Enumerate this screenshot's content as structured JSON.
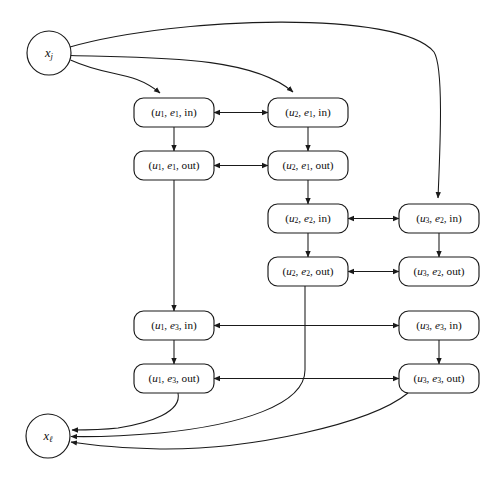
{
  "figure": {
    "type": "directed-graph-diagram",
    "canvas": {
      "width": 494,
      "height": 481
    },
    "background_color": "#ffffff",
    "stroke_color": "#1a1a1a",
    "text_color": "#0d0d0d"
  },
  "terminals": {
    "source": {
      "id": "x_j",
      "label_base": "x",
      "label_sub": "j",
      "shape": "circle",
      "cx": 49,
      "cy": 53,
      "r": 22
    },
    "sink": {
      "id": "x_l",
      "label_base": "x",
      "label_sub": "ℓ",
      "shape": "circle",
      "cx": 48,
      "cy": 436,
      "r": 22
    }
  },
  "nodes": [
    {
      "id": "u1e1in",
      "u": "u",
      "u_sub": "1",
      "e": "e",
      "e_sub": "1",
      "dir": "in",
      "text": "(u1, e1, in)",
      "x": 134,
      "y": 98,
      "w": 80,
      "h": 29
    },
    {
      "id": "u2e1in",
      "u": "u",
      "u_sub": "2",
      "e": "e",
      "e_sub": "1",
      "dir": "in",
      "text": "(u2, e1, in)",
      "x": 268,
      "y": 98,
      "w": 80,
      "h": 29
    },
    {
      "id": "u1e1out",
      "u": "u",
      "u_sub": "1",
      "e": "e",
      "e_sub": "1",
      "dir": "out",
      "text": "(u1, e1, out)",
      "x": 134,
      "y": 151,
      "w": 80,
      "h": 29
    },
    {
      "id": "u2e1out",
      "u": "u",
      "u_sub": "2",
      "e": "e",
      "e_sub": "1",
      "dir": "out",
      "text": "(u2, e1, out)",
      "x": 268,
      "y": 151,
      "w": 80,
      "h": 29
    },
    {
      "id": "u2e2in",
      "u": "u",
      "u_sub": "2",
      "e": "e",
      "e_sub": "2",
      "dir": "in",
      "text": "(u2, e2, in)",
      "x": 268,
      "y": 204,
      "w": 80,
      "h": 29
    },
    {
      "id": "u3e2in",
      "u": "u",
      "u_sub": "3",
      "e": "e",
      "e_sub": "2",
      "dir": "in",
      "text": "(u3, e2, in)",
      "x": 399,
      "y": 204,
      "w": 80,
      "h": 29
    },
    {
      "id": "u2e2out",
      "u": "u",
      "u_sub": "2",
      "e": "e",
      "e_sub": "2",
      "dir": "out",
      "text": "(u2, e2, out)",
      "x": 268,
      "y": 257,
      "w": 80,
      "h": 29
    },
    {
      "id": "u3e2out",
      "u": "u",
      "u_sub": "3",
      "e": "e",
      "e_sub": "2",
      "dir": "out",
      "text": "(u3, e2, out)",
      "x": 399,
      "y": 257,
      "w": 80,
      "h": 29
    },
    {
      "id": "u1e3in",
      "u": "u",
      "u_sub": "1",
      "e": "e",
      "e_sub": "3",
      "dir": "in",
      "text": "(u1, e3, in)",
      "x": 134,
      "y": 311,
      "w": 80,
      "h": 29
    },
    {
      "id": "u3e3in",
      "u": "u",
      "u_sub": "3",
      "e": "e",
      "e_sub": "3",
      "dir": "in",
      "text": "(u3, e3, in)",
      "x": 399,
      "y": 311,
      "w": 80,
      "h": 29
    },
    {
      "id": "u1e3out",
      "u": "u",
      "u_sub": "1",
      "e": "e",
      "e_sub": "3",
      "dir": "out",
      "text": "(u1, e3, out)",
      "x": 134,
      "y": 364,
      "w": 80,
      "h": 29
    },
    {
      "id": "u3e3out",
      "u": "u",
      "u_sub": "3",
      "e": "e",
      "e_sub": "3",
      "dir": "out",
      "text": "(u3, e3, out)",
      "x": 399,
      "y": 364,
      "w": 80,
      "h": 29
    }
  ],
  "edges": [
    {
      "id": "e-src-u1e1in",
      "from": "x_j",
      "to": "u1e1in",
      "kind": "curve",
      "arrows": "end",
      "d": "M 70.5 60 C 110 78, 132 70, 160 93"
    },
    {
      "id": "e-src-u2e1in",
      "from": "x_j",
      "to": "u2e1in",
      "kind": "curve",
      "arrows": "end",
      "d": "M 70.5 55.5 C 150 58, 250 55, 293 92"
    },
    {
      "id": "e-src-u3e2in",
      "from": "x_j",
      "to": "u3e2in",
      "kind": "curve",
      "arrows": "end",
      "d": "M 70 47 C 180 16, 400 10, 434 52 C 444 68, 440 150, 438 198"
    },
    {
      "id": "e-u1e1in-u2e1in",
      "from": "u1e1in",
      "to": "u2e1in",
      "kind": "h-bidir",
      "arrows": "both",
      "y": 112.5,
      "x1": 214,
      "x2": 268
    },
    {
      "id": "e-u1e1out-u2e1out",
      "from": "u1e1out",
      "to": "u2e1out",
      "kind": "h-bidir",
      "arrows": "both",
      "y": 165.5,
      "x1": 214,
      "x2": 268
    },
    {
      "id": "e-u2e2in-u3e2in",
      "from": "u2e2in",
      "to": "u3e2in",
      "kind": "h-bidir",
      "arrows": "both",
      "y": 218.5,
      "x1": 348,
      "x2": 399
    },
    {
      "id": "e-u2e2out-u3e2out",
      "from": "u2e2out",
      "to": "u3e2out",
      "kind": "h-bidir",
      "arrows": "both",
      "y": 271.5,
      "x1": 348,
      "x2": 399
    },
    {
      "id": "e-u1e3in-u3e3in",
      "from": "u1e3in",
      "to": "u3e3in",
      "kind": "h-bidir",
      "arrows": "both",
      "y": 325.5,
      "x1": 214,
      "x2": 399
    },
    {
      "id": "e-u1e3out-u3e3out",
      "from": "u1e3out",
      "to": "u3e3out",
      "kind": "h-bidir",
      "arrows": "both",
      "y": 378.5,
      "x1": 214,
      "x2": 399
    },
    {
      "id": "e-u1e1in-u1e1out",
      "from": "u1e1in",
      "to": "u1e1out",
      "kind": "v-arrow",
      "arrows": "end",
      "x": 174,
      "y1": 127,
      "y2": 151
    },
    {
      "id": "e-u2e1in-u2e1out",
      "from": "u2e1in",
      "to": "u2e1out",
      "kind": "v-arrow",
      "arrows": "end",
      "x": 308,
      "y1": 127,
      "y2": 151
    },
    {
      "id": "e-u2e1out-u2e2in",
      "from": "u2e1out",
      "to": "u2e2in",
      "kind": "v-arrow",
      "arrows": "end",
      "x": 308,
      "y1": 180,
      "y2": 204
    },
    {
      "id": "e-u2e2in-u2e2out",
      "from": "u2e2in",
      "to": "u2e2out",
      "kind": "v-arrow",
      "arrows": "end",
      "x": 308,
      "y1": 233,
      "y2": 257
    },
    {
      "id": "e-u3e2in-u3e2out",
      "from": "u3e2in",
      "to": "u3e2out",
      "kind": "v-arrow",
      "arrows": "end",
      "x": 439,
      "y1": 233,
      "y2": 257
    },
    {
      "id": "e-u3e3in-u3e3out",
      "from": "u3e3in",
      "to": "u3e3out",
      "kind": "v-arrow",
      "arrows": "end",
      "x": 439,
      "y1": 340,
      "y2": 364
    },
    {
      "id": "e-u1e1out-u1e3in",
      "from": "u1e1out",
      "to": "u1e3in",
      "kind": "v-arrow",
      "arrows": "end",
      "x": 174,
      "y1": 180,
      "y2": 311
    },
    {
      "id": "e-u1e3in-u1e3out",
      "from": "u1e3in",
      "to": "u1e3out",
      "kind": "v-arrow",
      "arrows": "end",
      "x": 174,
      "y1": 340,
      "y2": 364
    },
    {
      "id": "e-u1e3out-sink",
      "from": "u1e3out",
      "to": "x_l",
      "kind": "curve",
      "arrows": "end",
      "d": "M 178 393 C 182 412, 150 423, 118 428 C 100 430, 85 430, 72 430"
    },
    {
      "id": "e-u2e2out-sink",
      "from": "u2e2out",
      "to": "x_l",
      "kind": "curve",
      "arrows": "end",
      "d": "M 305 286 L 305 370 C 305 405, 240 425, 160 433 C 125 436, 95 437, 71 436.5"
    },
    {
      "id": "e-u3e3out-sink",
      "from": "u3e3out",
      "to": "x_l",
      "kind": "curve",
      "arrows": "end",
      "d": "M 408 393 C 370 424, 250 450, 160 449 C 120 448, 90 445, 71 442"
    }
  ],
  "legend": {
    "arrowhead_style": "filled-triangle",
    "node_shape": "rounded-rectangle",
    "terminal_shape": "circle"
  }
}
